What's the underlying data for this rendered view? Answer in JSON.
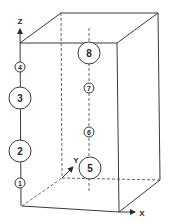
{
  "diagram": {
    "type": "3d-box-with-numbered-spheres",
    "axes": {
      "x": "X",
      "y": "Y",
      "z": "Z"
    },
    "spheres": [
      {
        "id": "1",
        "label": "1",
        "size": "small",
        "line": "z-axis"
      },
      {
        "id": "2",
        "label": "2",
        "size": "large",
        "line": "z-axis"
      },
      {
        "id": "3",
        "label": "3",
        "size": "large",
        "line": "z-axis"
      },
      {
        "id": "4",
        "label": "4",
        "size": "small",
        "line": "z-axis"
      },
      {
        "id": "5",
        "label": "5",
        "size": "large",
        "line": "center"
      },
      {
        "id": "6",
        "label": "6",
        "size": "small",
        "line": "center"
      },
      {
        "id": "7",
        "label": "7",
        "size": "small",
        "line": "center"
      },
      {
        "id": "8",
        "label": "8",
        "size": "large",
        "line": "center"
      }
    ],
    "colors": {
      "line": "#3a3a3a",
      "background": "#ffffff"
    }
  }
}
